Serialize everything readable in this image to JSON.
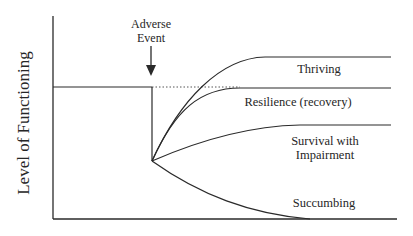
{
  "diagram": {
    "y_axis_label": "Level of Functioning",
    "event_label_line1": "Adverse",
    "event_label_line2": "Event",
    "outcomes": {
      "thriving": "Thriving",
      "resilience": "Resilience (recovery)",
      "survival_line1": "Survival with",
      "survival_line2": "Impairment",
      "succumbing": "Succumbing"
    },
    "colors": {
      "line": "#2a2a2a",
      "background": "#ffffff"
    }
  }
}
